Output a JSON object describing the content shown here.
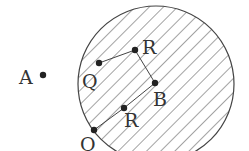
{
  "diagram": {
    "circle": {
      "cx": 156,
      "cy": 84,
      "r": 78,
      "hatched": true
    },
    "points": [
      {
        "id": "A",
        "label": "A",
        "x": 43,
        "y": 75,
        "lx": 19,
        "ly": 84
      },
      {
        "id": "Q1",
        "label": "Q",
        "x": 99,
        "y": 63,
        "lx": 82,
        "ly": 88
      },
      {
        "id": "R1",
        "label": "R",
        "x": 135,
        "y": 50,
        "lx": 142,
        "ly": 54
      },
      {
        "id": "B",
        "label": "B",
        "x": 155,
        "y": 83,
        "lx": 153,
        "ly": 106
      },
      {
        "id": "R2",
        "label": "R",
        "x": 124,
        "y": 108,
        "lx": 124,
        "ly": 127
      },
      {
        "id": "Q2",
        "label": "Q",
        "x": 94,
        "y": 130,
        "lx": 80,
        "ly": 151
      }
    ],
    "segments": [
      [
        "Q1",
        "R1"
      ],
      [
        "R1",
        "B"
      ],
      [
        "B",
        "R2"
      ],
      [
        "R2",
        "Q2"
      ]
    ],
    "colors": {
      "stroke": "#444444",
      "hatch": "#555555",
      "dot": "#222222",
      "label": "#333333"
    }
  }
}
